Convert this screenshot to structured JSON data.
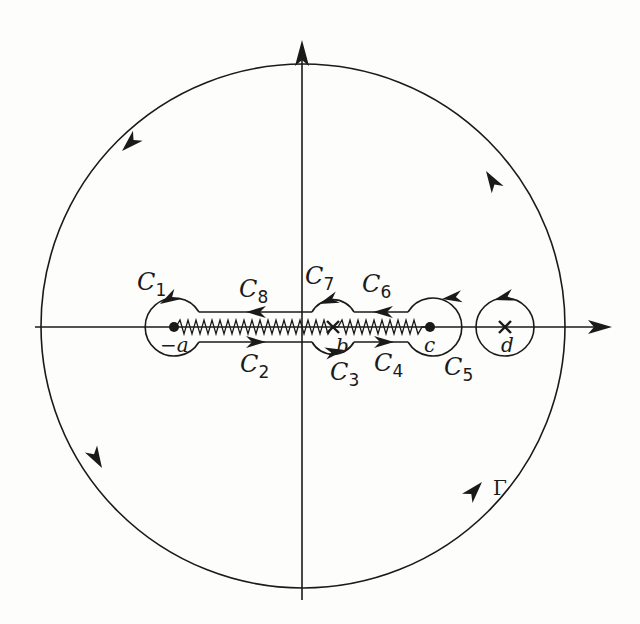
{
  "figure": {
    "colors": {
      "ink": "#1a1a1a",
      "background": "#fdfdfb"
    }
  },
  "points": {
    "neg_a": {
      "label": "−a",
      "kind": "branch-point"
    },
    "b": {
      "label": "b",
      "kind": "pole"
    },
    "c": {
      "label": "c",
      "kind": "branch-point"
    },
    "d": {
      "label": "d",
      "kind": "pole"
    }
  },
  "contours": {
    "C1": {
      "letter": "C",
      "sub": "1"
    },
    "C2": {
      "letter": "C",
      "sub": "2"
    },
    "C3": {
      "letter": "C",
      "sub": "3"
    },
    "C4": {
      "letter": "C",
      "sub": "4"
    },
    "C5": {
      "letter": "C",
      "sub": "5"
    },
    "C6": {
      "letter": "C",
      "sub": "6"
    },
    "C7": {
      "letter": "C",
      "sub": "7"
    },
    "C8": {
      "letter": "C",
      "sub": "8"
    },
    "Gamma": {
      "label": "Γ"
    }
  }
}
